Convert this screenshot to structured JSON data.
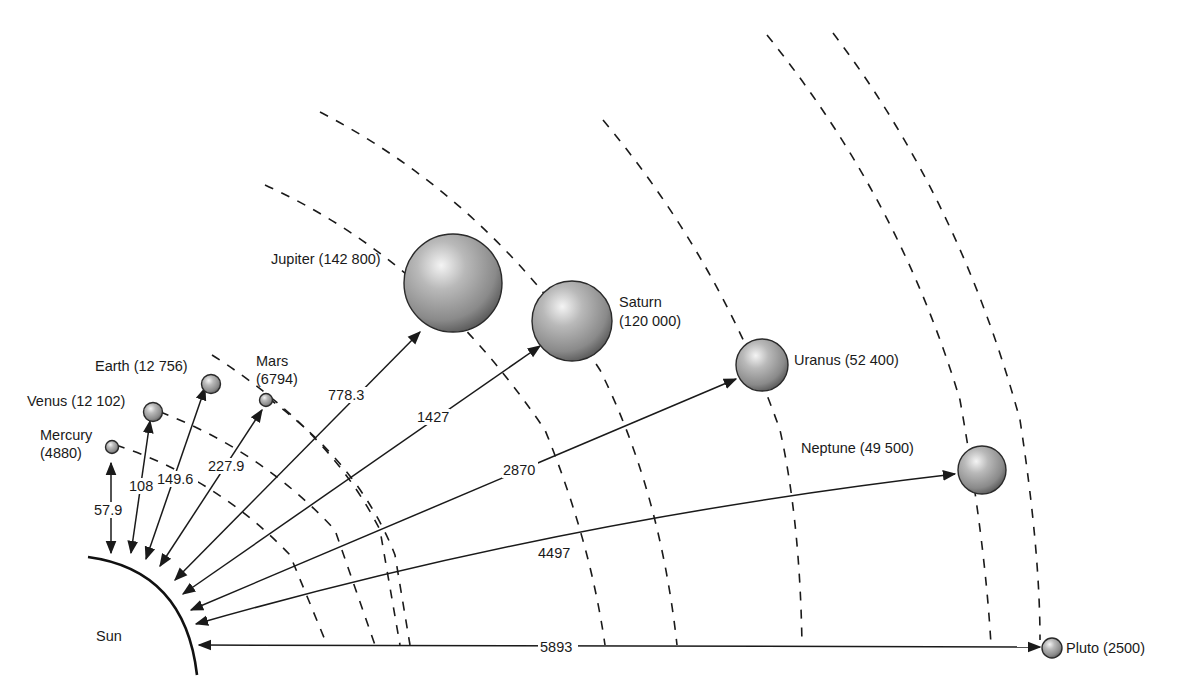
{
  "diagram": {
    "sun": {
      "label": "Sun"
    },
    "planets": [
      {
        "name": "Mercury",
        "diameter": "4880",
        "label_line1": "Mercury",
        "label_line2": "(4880)",
        "distance": "57.9"
      },
      {
        "name": "Venus",
        "diameter": "12 102",
        "label_line1": "Venus (12 102)",
        "distance": "108"
      },
      {
        "name": "Earth",
        "diameter": "12 756",
        "label_line1": "Earth (12 756)",
        "distance": "149.6"
      },
      {
        "name": "Mars",
        "diameter": "6794",
        "label_line1": "Mars",
        "label_line2": "(6794)",
        "distance": "227.9"
      },
      {
        "name": "Jupiter",
        "diameter": "142 800",
        "label_line1": "Jupiter (142 800)",
        "distance": "778.3"
      },
      {
        "name": "Saturn",
        "diameter": "120 000",
        "label_line1": "Saturn",
        "label_line2": "(120 000)",
        "distance": "1427"
      },
      {
        "name": "Uranus",
        "diameter": "52 400",
        "label_line1": "Uranus (52 400)",
        "distance": "2870"
      },
      {
        "name": "Neptune",
        "diameter": "49 500",
        "label_line1": "Neptune (49 500)",
        "distance": "4497"
      },
      {
        "name": "Pluto",
        "diameter": "2500",
        "label_line1": "Pluto (2500)",
        "distance": "5893"
      }
    ],
    "colors": {
      "ink": "#1a1a1a",
      "planet_highlight": "#f2f2f2",
      "planet_mid": "#a8a8a8",
      "planet_shadow": "#5a5a5a",
      "background": "#ffffff"
    }
  }
}
